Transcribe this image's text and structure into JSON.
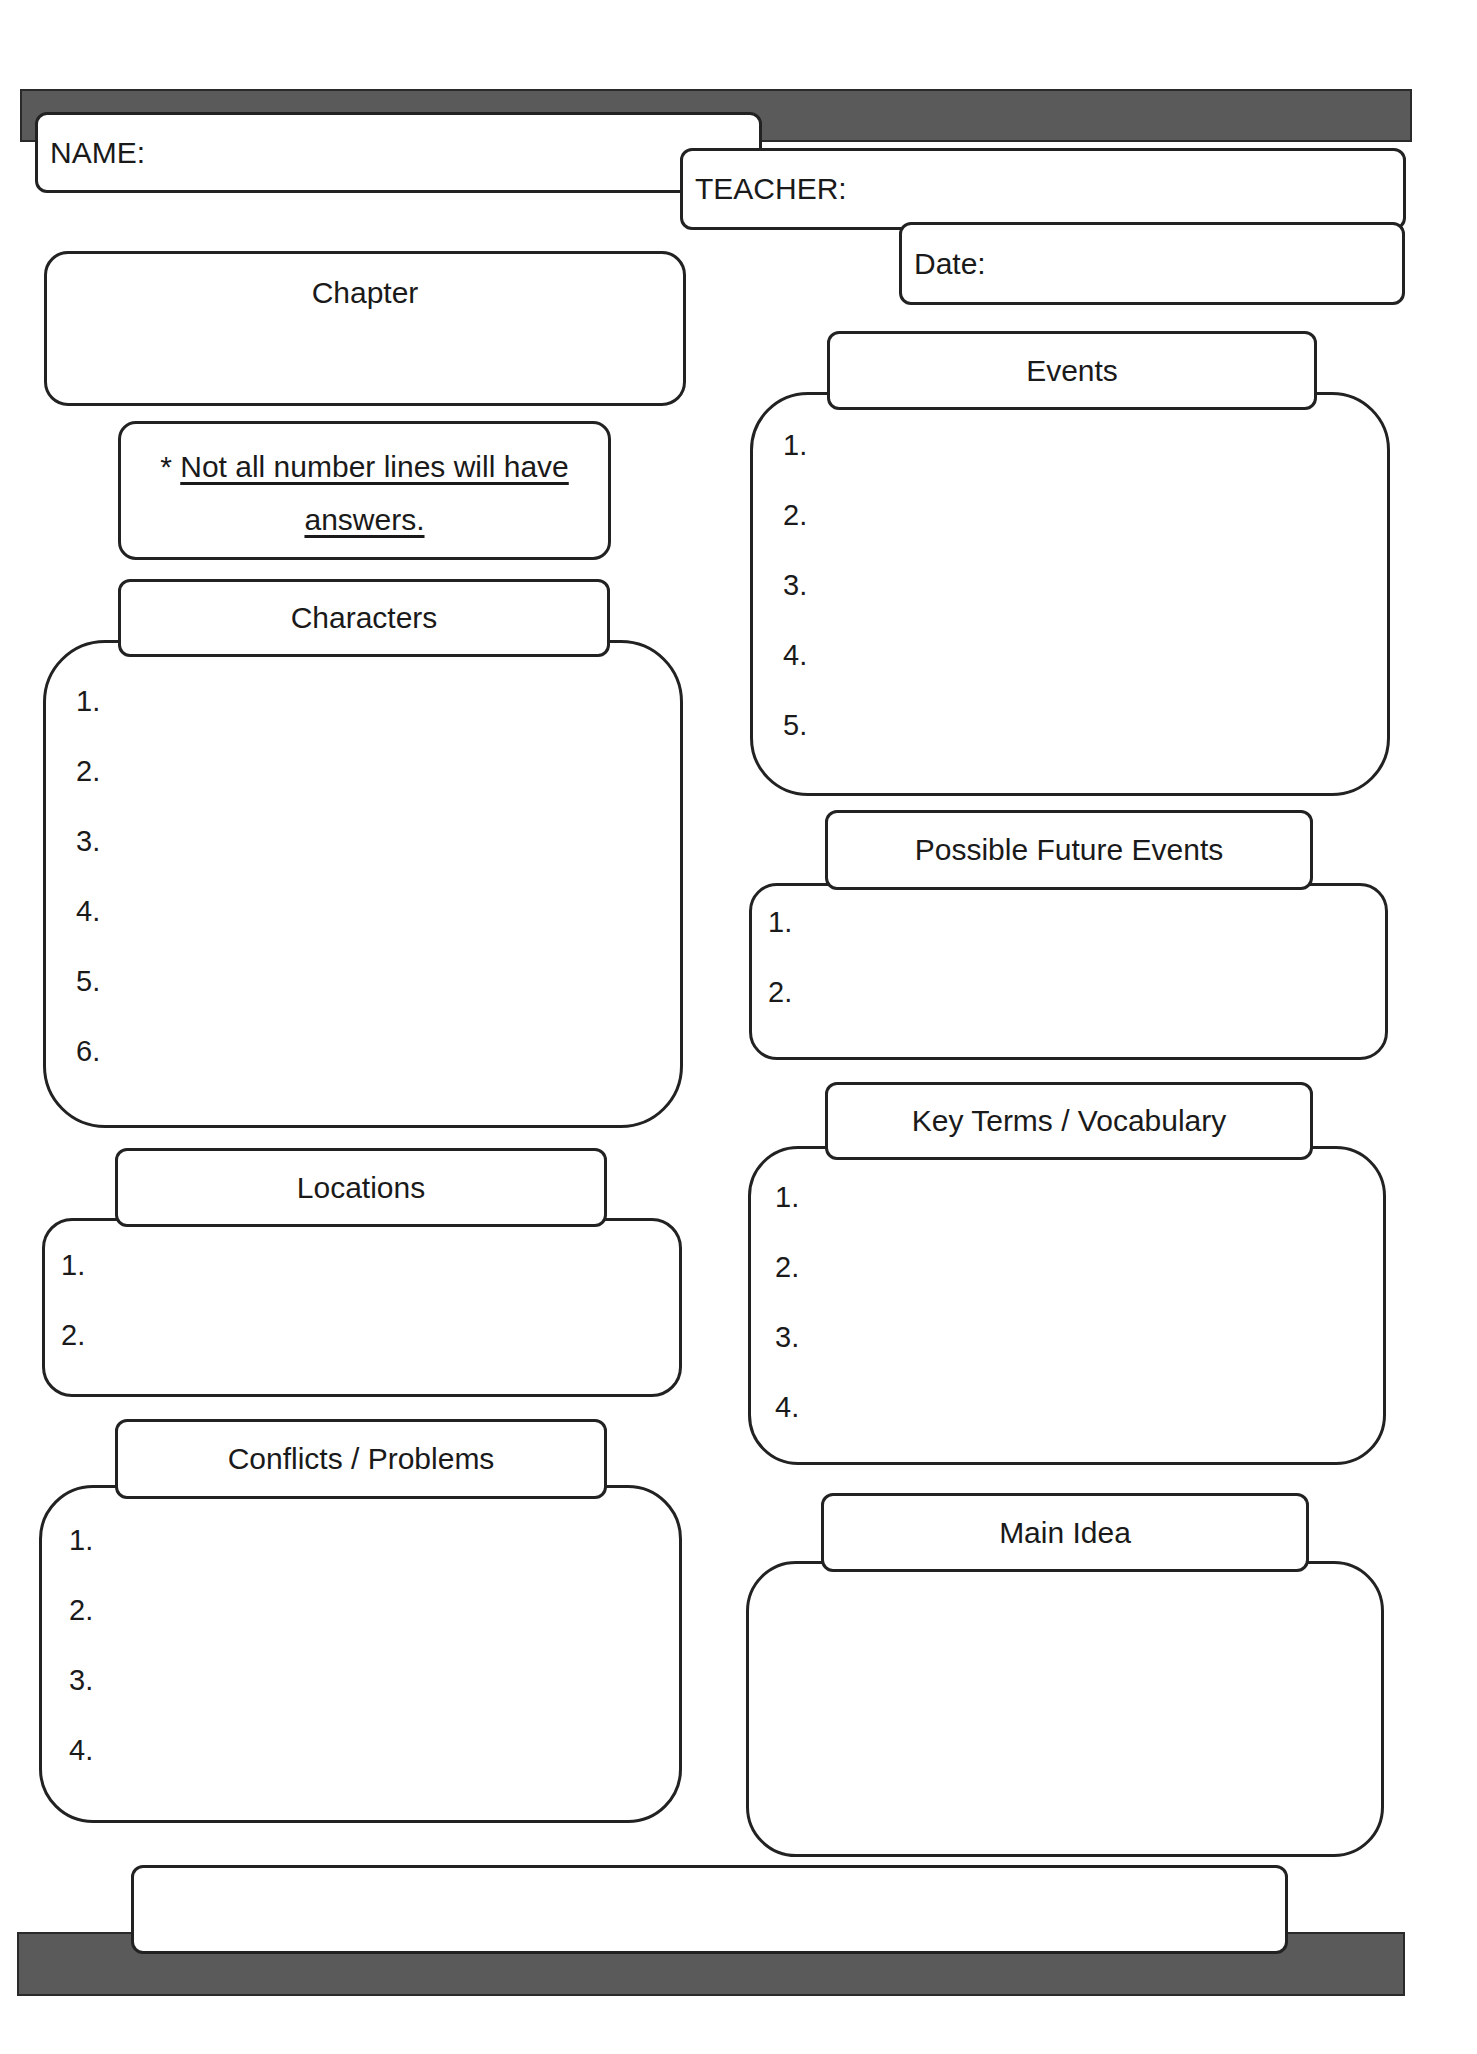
{
  "header": {
    "name_label": "NAME:",
    "teacher_label": "TEACHER:",
    "date_label": "Date:"
  },
  "chapter": {
    "label": "Chapter"
  },
  "note": {
    "asterisk": "*",
    "text_line1": "Not all number lines will have",
    "text_line2": "answers."
  },
  "sections": {
    "characters": {
      "title": "Characters",
      "numbers": [
        "1.",
        "2.",
        "3.",
        "4.",
        "5.",
        "6."
      ]
    },
    "locations": {
      "title": "Locations",
      "numbers": [
        "1.",
        "2."
      ]
    },
    "conflicts": {
      "title": "Conflicts / Problems",
      "numbers": [
        "1.",
        "2.",
        "3.",
        "4."
      ]
    },
    "events": {
      "title": "Events",
      "numbers": [
        "1.",
        "2.",
        "3.",
        "4.",
        "5."
      ]
    },
    "future_events": {
      "title": "Possible Future Events",
      "numbers": [
        "1.",
        "2."
      ]
    },
    "key_terms": {
      "title": "Key Terms / Vocabulary",
      "numbers": [
        "1.",
        "2.",
        "3.",
        "4."
      ]
    },
    "main_idea": {
      "title": "Main Idea"
    }
  },
  "colors": {
    "bar": "#5a5a5a",
    "border": "#222222",
    "background": "#ffffff"
  }
}
